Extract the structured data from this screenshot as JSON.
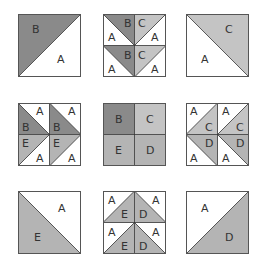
{
  "colors": {
    "A": "#ffffff",
    "B": "#8a8a8a",
    "C": "#c4c4c4",
    "D": "#b4b4b4",
    "E": "#b4b4b4",
    "stroke": "#333333"
  },
  "tiles": [
    {
      "id": "r1c1",
      "desc": "half-square triangle B over A",
      "labels": [
        "B",
        "A"
      ]
    },
    {
      "id": "r1c2",
      "desc": "two flying geese rows, triangle down split B/C with A sides",
      "labels": [
        "B",
        "C",
        "A",
        "A",
        "B",
        "C",
        "A",
        "A"
      ]
    },
    {
      "id": "r1c3",
      "desc": "half-square triangle C over A",
      "labels": [
        "C",
        "A"
      ]
    },
    {
      "id": "r2c1",
      "desc": "two flying geese columns pointing right split B/E with A",
      "labels": [
        "A",
        "B",
        "E",
        "A",
        "A",
        "B",
        "E",
        "A"
      ]
    },
    {
      "id": "r2c2",
      "desc": "four-patch B C E D",
      "labels": [
        "B",
        "C",
        "E",
        "D"
      ]
    },
    {
      "id": "r2c3",
      "desc": "two flying geese columns pointing left split C/D with A",
      "labels": [
        "A",
        "C",
        "D",
        "A",
        "A",
        "C",
        "D",
        "A"
      ]
    },
    {
      "id": "r3c1",
      "desc": "half-square triangle E under A",
      "labels": [
        "A",
        "E"
      ]
    },
    {
      "id": "r3c2",
      "desc": "two flying geese rows pointing up split E/D with A",
      "labels": [
        "A",
        "E",
        "D",
        "A",
        "A",
        "E",
        "D",
        "A"
      ]
    },
    {
      "id": "r3c3",
      "desc": "half-square triangle A over D",
      "labels": [
        "A",
        "D"
      ]
    }
  ]
}
